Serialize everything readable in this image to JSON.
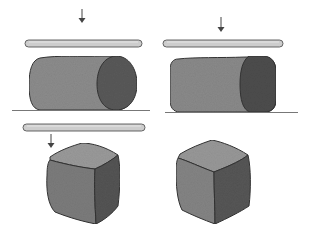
{
  "illustration": {
    "description": "Clay shapes being flattened by rolling pins: a cylinder, a flattened rounded block, and two rounded cubes",
    "panels": [
      {
        "id": "top-left",
        "object": "cylinder",
        "has_arrow": true,
        "has_rod": true,
        "has_ground": true
      },
      {
        "id": "top-right",
        "object": "flattened-block",
        "has_arrow": true,
        "has_rod": true,
        "has_ground": true
      },
      {
        "id": "bottom-left",
        "object": "rounded-cube",
        "has_arrow": true,
        "has_rod": true,
        "has_ground": false
      },
      {
        "id": "bottom-right",
        "object": "rounded-cube",
        "has_arrow": false,
        "has_rod": false,
        "has_ground": false
      }
    ],
    "colors": {
      "background": "#ffffff",
      "outline": "#3a3a3a",
      "rod_fill": "#c9c9c9",
      "light_face": "#8e8e8e",
      "mid_face": "#7a7a7a",
      "dark_face": "#555555",
      "top_face": "#9a9a9a",
      "ground": "#6a6a6a"
    }
  }
}
